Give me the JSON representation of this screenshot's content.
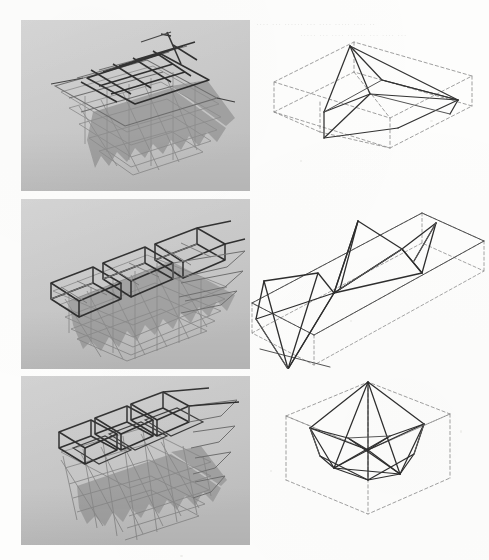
{
  "document": {
    "kind": "scanned-book-figure-plate",
    "page_background": "#fdfdfc",
    "photo_background": "#c9c9c9",
    "photo_shadow": "#969696",
    "ink_dark": "#2b2b2b",
    "ink_mid": "#5a5a5a",
    "ink_light": "#9a9a9a",
    "ink_dashed": "#8e8e8e"
  },
  "ghost_text": {
    "note": "illegible print bleed-through from reverse of page",
    "lines": [
      "··· ···· ····· ··· ···· ······ ·· ···· ····· ··· ····",
      "···· ··· ······ ··· ···· ····· ···· ··",
      "····· ··· ···· ······ ··· ···· ···"
    ]
  },
  "figure": {
    "layout": "3 rows × 2 columns; left = photograph of physical model, right = line drawing of unit cell in dashed bounding box",
    "rows": [
      {
        "id": "row-1",
        "photo": {
          "name": "flat-square-grid-model",
          "description": "planar square grid of folded plates, stepped lower layers, photographed at an oblique angle on grey ground with cast shadow",
          "grid_columns": 5,
          "grid_rows": 5,
          "step_layers": 5
        },
        "drawing": {
          "name": "flat-slab-unit-cell",
          "description": "flat rectangular box (dashed) containing a solid prismatic wedge polyhedron",
          "bounding_box": "flat rectangular prism",
          "box_style": "dashed",
          "solid_style": "solid"
        }
      },
      {
        "id": "row-2",
        "photo": {
          "name": "linear-barrel-vault-model",
          "description": "three-bay elongated folded plate vault, stepped layers descending, photographed on grey ground with cast shadow",
          "grid_columns": 3,
          "grid_rows": 3,
          "step_layers": 6
        },
        "drawing": {
          "name": "elongated-slab-unit-cell",
          "description": "long rectangular box (dashed) containing a zig-zag chain of solid triangular facets",
          "bounding_box": "elongated rectangular prism",
          "box_style": "dashed",
          "solid_style": "solid",
          "zigzag_peaks": 3
        }
      },
      {
        "id": "row-3",
        "photo": {
          "name": "deep-cellular-block-model",
          "description": "deep cellular block of cube-like folded cells in a 4×4 array with stepped lower layers, photographed on grey ground with cast shadow",
          "grid_columns": 4,
          "grid_rows": 4,
          "step_layers": 5
        },
        "drawing": {
          "name": "cube-unit-cell",
          "description": "cube (dashed) containing an inscribed solid polyhedron with an apex above a hexagonal lower rim",
          "bounding_box": "cube",
          "box_style": "dashed",
          "solid_style": "solid"
        }
      }
    ]
  }
}
